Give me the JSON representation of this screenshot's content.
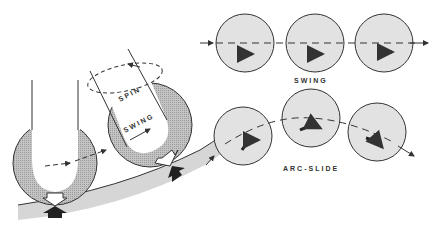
{
  "labels": {
    "spin": "SPIN",
    "swing_left": "SWING",
    "swing_right": "SWING",
    "arc_slide": "ARC-SLIDE"
  },
  "colors": {
    "ink": "#333333",
    "ball_fill": "#e2e2e2",
    "hatch": "#b5b5b5",
    "track": "#d6d6d6"
  },
  "panels": [
    {
      "name": "swing",
      "label_key": "swing_right",
      "balls": 3
    },
    {
      "name": "arc-slide",
      "label_key": "arc_slide",
      "balls": 3
    }
  ]
}
